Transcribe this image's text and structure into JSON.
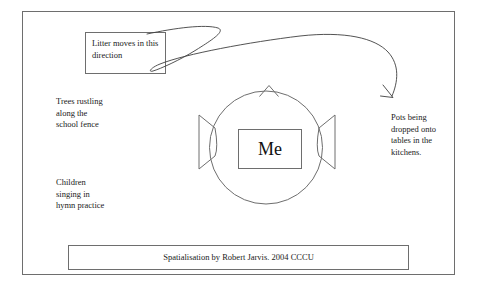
{
  "diagram": {
    "title_box": {
      "label": "Litter moves in this direction"
    },
    "center": {
      "label": "Me"
    },
    "annotations": [
      {
        "name": "trees",
        "label": "Trees rustling\nalong the\nschool fence"
      },
      {
        "name": "children",
        "label": "Children\nsinging in\nhymn practice"
      },
      {
        "name": "pots",
        "label": "Pots being\ndropped onto\ntables in the\nkitchens."
      }
    ],
    "caption": {
      "label": "Spatialisation by Robert Jarvis. 2004 CCCU"
    },
    "colors": {
      "ink": "#1a1a1a",
      "stroke": "#6e6e6e",
      "paper": "#ffffff"
    }
  }
}
